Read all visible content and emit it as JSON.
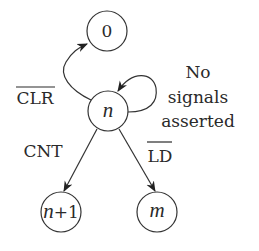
{
  "diagram": {
    "type": "state-transition",
    "states": [
      {
        "id": "zero",
        "label": "0"
      },
      {
        "id": "n",
        "label": "n"
      },
      {
        "id": "n_plus_1",
        "label_var": "n",
        "label_suffix": "+1"
      },
      {
        "id": "m",
        "label": "m"
      }
    ],
    "transitions": [
      {
        "from": "n",
        "to": "zero",
        "label": "CLR",
        "active_low": true
      },
      {
        "from": "n",
        "to": "n",
        "label_lines": [
          "No",
          "signals",
          "asserted"
        ]
      },
      {
        "from": "n",
        "to": "n_plus_1",
        "label": "CNT",
        "active_low": false
      },
      {
        "from": "n",
        "to": "m",
        "label": "LD",
        "active_low": true
      }
    ],
    "colors": {
      "stroke": "#333333",
      "text": "#2a2a2a",
      "background": "#ffffff"
    }
  }
}
